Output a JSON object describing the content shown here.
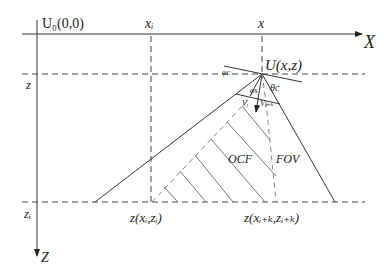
{
  "diagram": {
    "origin_label": "U₀(0,0)",
    "x_axis_label": "X",
    "z_axis_label": "Z",
    "x_i_label": "xᵢ",
    "x_label": "x",
    "z_label": "z",
    "z_i_label": "zᵢ",
    "camera_label": "U(x,z)",
    "phi_c_label": "φc",
    "phi_s_label": "φs",
    "theta_c_label": "θc",
    "v_i_label": "Vᵢ",
    "v_ik_label": "Vᵢ₊ₖ",
    "ocf_label": "OCF",
    "fov_label": "FOV",
    "point_i_label": "z(xᵢ,zᵢ)",
    "point_ik_label": "z(xᵢ₊ₖ,zᵢ₊ₖ)"
  }
}
